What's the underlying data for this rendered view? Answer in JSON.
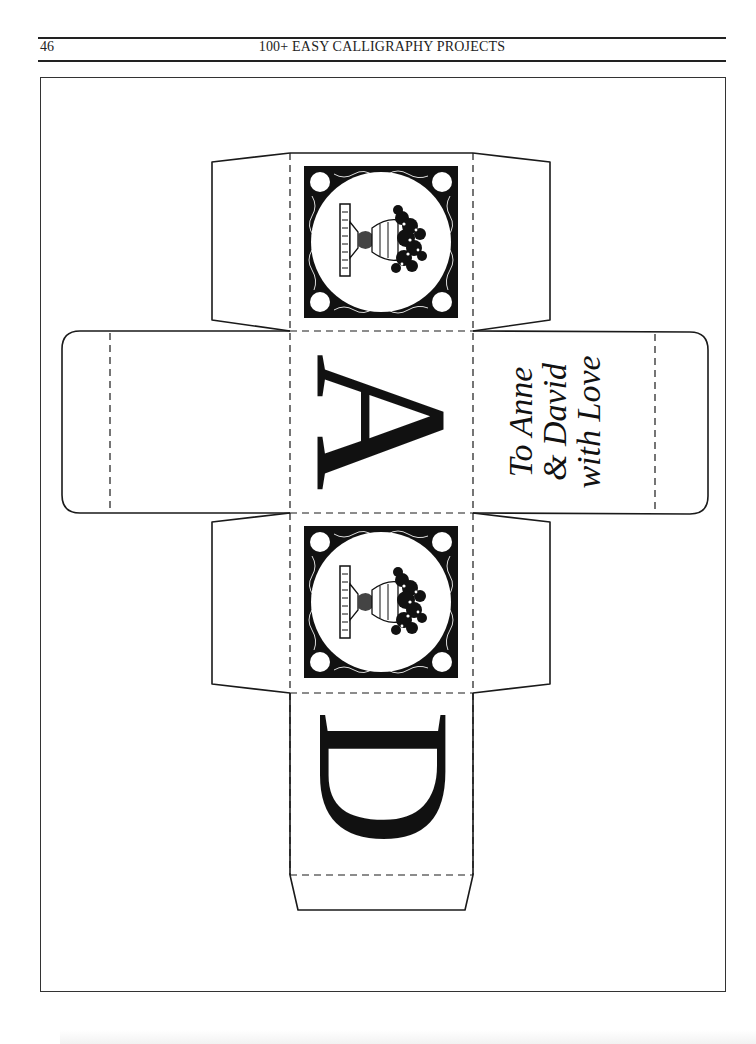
{
  "header": {
    "page_number": "46",
    "running_title": "100+ EASY CALLIGRAPHY PROJECTS"
  },
  "box_template": {
    "description": "Cube gift box die-cut template with dashed fold lines",
    "panels": {
      "top_panel": {
        "content": "engraved-urn-illustration",
        "icon": "urn-with-tree-icon"
      },
      "front_panel": {
        "content": "initial-letter",
        "letter": "A"
      },
      "right_panel": {
        "content": "calligraphy-message",
        "lines": [
          "To Anne",
          "& David",
          "with Love"
        ]
      },
      "left_panel": {
        "content": "blank"
      },
      "bottom_panel": {
        "content": "engraved-urn-illustration",
        "icon": "urn-with-tree-icon"
      },
      "back_panel": {
        "content": "initial-letter",
        "letter": "D"
      }
    },
    "colors": {
      "ink": "#111111",
      "paper": "#ffffff"
    }
  }
}
